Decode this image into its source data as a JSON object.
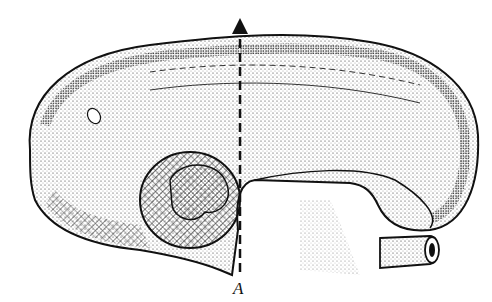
{
  "figure": {
    "type": "anatomical illustration",
    "label_A": "A",
    "colors": {
      "ink": "#111111",
      "background": "#ffffff"
    }
  }
}
